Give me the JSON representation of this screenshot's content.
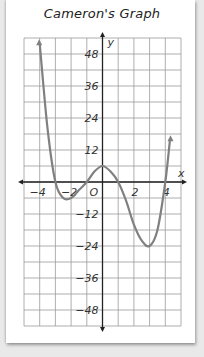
{
  "chart_data": {
    "type": "line",
    "title": "Cameron's Graph",
    "xlabel": "x",
    "ylabel": "y",
    "origin_label": "O",
    "xlim": [
      -5,
      5
    ],
    "ylim": [
      -54,
      54
    ],
    "grid": true,
    "grid_step": {
      "x": 1,
      "y": 6
    },
    "x_ticks": [
      -4,
      -2,
      2,
      4
    ],
    "x_tick_labels": [
      "-4",
      "-2",
      "2",
      "4"
    ],
    "y_ticks": [
      48,
      36,
      24,
      12,
      -12,
      -24,
      -36,
      -48
    ],
    "y_tick_labels": [
      "48",
      "36",
      "24",
      "12",
      "-12",
      "-24",
      "-36",
      "-48"
    ],
    "series": [
      {
        "name": "f(x)",
        "description": "Quartic polynomial with x-intercepts near -3, -1, 1, 4; local min near (-2, -6), local max near (0, 6), local min near (3, -24); both ends rise",
        "x": [
          -4.0,
          -3.5,
          -3.0,
          -2.5,
          -2.0,
          -1.5,
          -1.0,
          -0.5,
          0.0,
          0.5,
          1.0,
          1.5,
          2.0,
          2.5,
          3.0,
          3.5,
          4.0,
          4.3
        ],
        "y": [
          52,
          20,
          0,
          -6,
          -6,
          -3,
          0,
          4,
          6,
          4,
          0,
          -7,
          -16,
          -22,
          -24,
          -18,
          0,
          16
        ]
      }
    ],
    "colors": {
      "curve": "#808080",
      "grid": "#9a9a9a",
      "axis": "#222222"
    }
  }
}
